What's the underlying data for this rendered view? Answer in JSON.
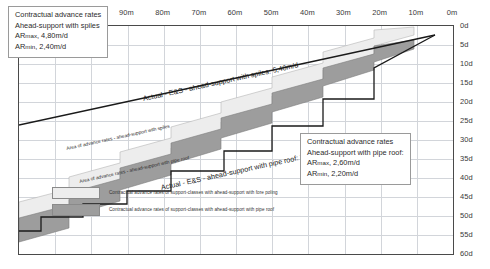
{
  "chart_data": {
    "type": "area",
    "title": "",
    "xlabel": "",
    "ylabel": "",
    "xlim": [
      120,
      0
    ],
    "ylim": [
      0,
      60
    ],
    "x_unit": "m",
    "y_unit": "d",
    "grid": true,
    "x_ticks": [
      "120m",
      "110m",
      "100m",
      "90m",
      "80m",
      "70m",
      "60m",
      "50m",
      "40m",
      "30m",
      "20m",
      "10m",
      "0m"
    ],
    "y_ticks": [
      "0d",
      "5d",
      "10d",
      "15d",
      "20d",
      "25d",
      "30d",
      "35d",
      "40d",
      "45d",
      "50d",
      "55d",
      "60d"
    ],
    "series": [
      {
        "name": "Actual - E&S - ahead-support with spiles: 5,40m/d",
        "type": "line",
        "rate": "5,40m/d",
        "points": [
          [
            120,
            26.0
          ],
          [
            0,
            0.0
          ]
        ]
      },
      {
        "name": "Actual - E&S - ahead-support with pipe roof: 2,35 m/d",
        "type": "step-line",
        "rate": "2,35 m/d",
        "points": [
          [
            120,
            51.0
          ],
          [
            105,
            51.0
          ],
          [
            105,
            47.0
          ],
          [
            90,
            47.0
          ],
          [
            90,
            42.0
          ],
          [
            75,
            42.0
          ],
          [
            75,
            35.5
          ],
          [
            58,
            35.5
          ],
          [
            58,
            30.0
          ],
          [
            42,
            30.0
          ],
          [
            42,
            23.0
          ],
          [
            28,
            23.0
          ],
          [
            28,
            14.0
          ],
          [
            14,
            14.0
          ],
          [
            14,
            5.0
          ],
          [
            0,
            0.0
          ]
        ]
      },
      {
        "name": "Contractual advance rates of support-classes with ahead-support with fore poling",
        "type": "band",
        "fill": "#ededed"
      },
      {
        "name": "Contractual advance rates of support-classes with ahead-support with pipe roof",
        "type": "band",
        "fill": "#9d9d9d"
      }
    ],
    "annotations": [
      {
        "name": "area-spiles",
        "text": "Area of advance rates - ahead-support with spiles"
      },
      {
        "name": "area-piperoof",
        "text": "Area of advance rates - ahead-support with pipe roof"
      }
    ]
  },
  "boxes": {
    "spiles": {
      "line1": "Contractual advance rates",
      "line2": "Ahead-support with spiles",
      "line3_prefix": "AR",
      "line3_sub": "max",
      "line3_value": ", 4,80m/d",
      "line4_prefix": "AR",
      "line4_sub": "min",
      "line4_value": ",  2,40m/d"
    },
    "piperoof": {
      "line1": "Contractual advance rates",
      "line2": "Ahead-support with pipe roof:",
      "line3_prefix": "AR",
      "line3_sub": "max",
      "line3_value": ", 2,60m/d",
      "line4_prefix": "AR",
      "line4_sub": "min",
      "line4_value": ",  2,20m/d"
    }
  },
  "legend": {
    "position": "bottom",
    "items": [
      {
        "swatch": "light",
        "color": "#ededed",
        "label": "Contractual advance rates of support-classes with ahead-support with fore poling"
      },
      {
        "swatch": "dark",
        "color": "#9d9d9d",
        "label": "Contractual advance rates of support-classes with ahead-support with pipe roof"
      }
    ]
  },
  "diagonal_labels": {
    "top": "Actual - E&S - ahead-support with spiles: 5,40m/d",
    "bottom": "Actual - E&S - ahead-support with pipe roof: 2,35 m/d"
  },
  "band_labels": {
    "spiles": "Area of advance rates - ahead-support with spiles",
    "piperoof": "Area of advance rates - ahead-support with pipe roof"
  },
  "colors": {
    "band_light": "#ededed",
    "band_dark": "#9d9d9d",
    "grid": "#d2d5da",
    "frame": "#4a4a4a",
    "line": "#1a1a1a"
  }
}
